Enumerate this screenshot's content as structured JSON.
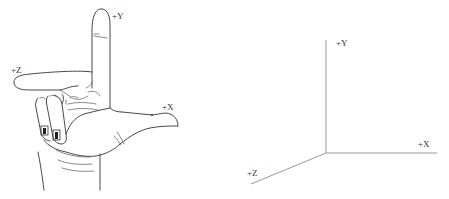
{
  "hand_panel": {
    "labels": {
      "y": "+Y",
      "z": "+Z",
      "x": "+X"
    },
    "finger_mapping": {
      "thumb": "+X",
      "index": "+Y",
      "middle": "+Z"
    }
  },
  "axes_panel": {
    "labels": {
      "y": "+Y",
      "x": "+X",
      "z": "+Z"
    },
    "origin": [
      326,
      153
    ],
    "axis_color": "#9a9a9a"
  }
}
